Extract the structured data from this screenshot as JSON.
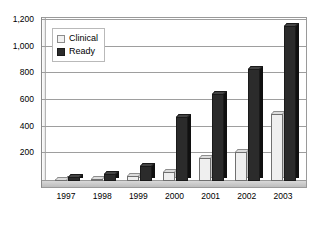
{
  "chart_data": {
    "type": "bar",
    "title": "",
    "subtitle": "",
    "xlabel": "",
    "ylabel": "",
    "categories": [
      "1997",
      "1998",
      "1999",
      "2000",
      "2001",
      "2002",
      "2003"
    ],
    "series": [
      {
        "name": "Clinical",
        "color": "#efefef",
        "values": [
          5,
          15,
          40,
          70,
          175,
          220,
          500
        ]
      },
      {
        "name": "Ready",
        "color": "#2b2b2b",
        "values": [
          30,
          50,
          110,
          480,
          650,
          840,
          1160
        ]
      }
    ],
    "ylim": [
      0,
      1200
    ],
    "yticks": [
      200,
      400,
      600,
      800,
      1000,
      1200
    ],
    "ytick_labels": [
      "200",
      "400",
      "600",
      "800",
      "1,000",
      "1,200"
    ],
    "grid": true,
    "legend_position": "top-left-inside",
    "style": "3d-clustered-column"
  },
  "legend": {
    "items": [
      {
        "label": "Clinical",
        "swatch": "clinical-swatch"
      },
      {
        "label": "Ready",
        "swatch": "ready-swatch"
      }
    ]
  }
}
